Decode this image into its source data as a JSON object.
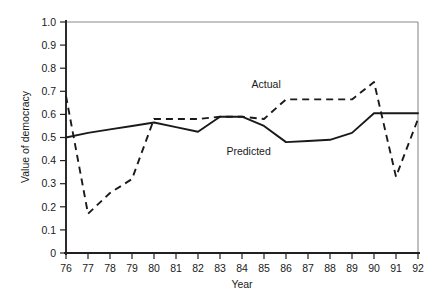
{
  "chart_data": {
    "type": "line",
    "title": "",
    "xlabel": "Year",
    "ylabel": "Value of democracy",
    "x": [
      76,
      77,
      78,
      79,
      80,
      81,
      82,
      83,
      84,
      85,
      86,
      87,
      88,
      89,
      90,
      91,
      92
    ],
    "xtick_labels": [
      "76",
      "77",
      "78",
      "79",
      "80",
      "81",
      "82",
      "83",
      "84",
      "85",
      "86",
      "87",
      "88",
      "89",
      "90",
      "91",
      "92"
    ],
    "ytick_labels": [
      "1.0",
      "0.9",
      "0.8",
      "0.7",
      "0.6",
      "0.5",
      "0.4",
      "0.3",
      "0.2",
      "0.1",
      "0"
    ],
    "ytick_values": [
      1.0,
      0.9,
      0.8,
      0.7,
      0.6,
      0.5,
      0.4,
      0.3,
      0.2,
      0.1,
      0
    ],
    "ylim": [
      0,
      1.0
    ],
    "xlim": [
      76,
      92
    ],
    "grid": false,
    "legend_position": "inline-annotations",
    "series": [
      {
        "name": "Actual",
        "style": "dashed",
        "color": "#1a1a1a",
        "values": [
          0.68,
          0.17,
          0.26,
          0.32,
          0.58,
          0.58,
          0.58,
          0.59,
          0.59,
          0.58,
          0.665,
          0.665,
          0.665,
          0.665,
          0.74,
          0.33,
          0.58
        ]
      },
      {
        "name": "Predicted",
        "style": "solid",
        "color": "#1a1a1a",
        "values": [
          0.5,
          0.52,
          0.535,
          0.55,
          0.565,
          0.545,
          0.525,
          0.59,
          0.59,
          0.55,
          0.48,
          0.485,
          0.49,
          0.52,
          0.605,
          0.605,
          0.605
        ]
      }
    ],
    "annotations": [
      {
        "text": "Actual",
        "x": 85.1,
        "y": 0.715
      },
      {
        "text": "Predicted",
        "x": 84.3,
        "y": 0.425
      }
    ]
  }
}
